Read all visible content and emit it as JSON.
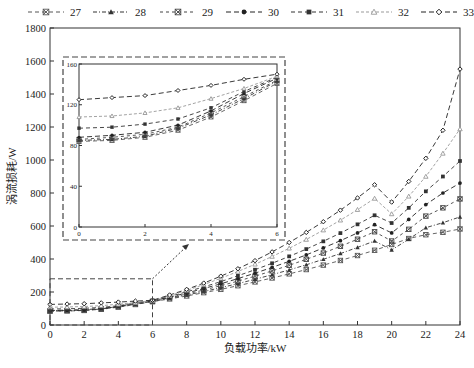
{
  "chart_data": {
    "type": "line",
    "title": "",
    "xlabel": "负载功率/kW",
    "ylabel": "涡流损耗/W",
    "xlim": [
      0,
      24
    ],
    "ylim": [
      0,
      1800
    ],
    "xticks": [
      0,
      2,
      4,
      6,
      8,
      10,
      12,
      14,
      16,
      18,
      20,
      22,
      24
    ],
    "yticks": [
      0,
      200,
      400,
      600,
      800,
      1000,
      1200,
      1400,
      1600,
      1800
    ],
    "grid": false,
    "legend_position": "top",
    "x": [
      0,
      1,
      2,
      3,
      4,
      5,
      6,
      7,
      8,
      9,
      10,
      11,
      12,
      13,
      14,
      15,
      16,
      17,
      18,
      19,
      20,
      21,
      22,
      23,
      24
    ],
    "series": [
      {
        "name": "27",
        "marker": "x-square",
        "color": "#555555",
        "values": [
          84,
          85,
          88,
          95,
          108,
          124,
          141,
          158,
          176,
          196,
          216,
          238,
          261,
          285,
          310,
          336,
          363,
          391,
          421,
          453,
          488,
          524,
          547,
          562,
          582
        ]
      },
      {
        "name": "28",
        "marker": "triangle",
        "color": "#333333",
        "values": [
          85,
          86,
          89,
          97,
          110,
          126,
          143,
          162,
          182,
          203,
          226,
          251,
          277,
          305,
          334,
          365,
          398,
          433,
          470,
          509,
          455,
          520,
          590,
          620,
          655
        ]
      },
      {
        "name": "29",
        "marker": "x-box",
        "color": "#444444",
        "values": [
          86,
          88,
          91,
          98,
          112,
          128,
          144,
          165,
          188,
          212,
          238,
          266,
          296,
          328,
          362,
          398,
          436,
          477,
          520,
          565,
          509,
          580,
          660,
          710,
          764
        ]
      },
      {
        "name": "30",
        "marker": "circle",
        "color": "#222222",
        "values": [
          88,
          90,
          93,
          100,
          114,
          131,
          146,
          169,
          194,
          221,
          250,
          281,
          314,
          349,
          386,
          425,
          467,
          511,
          558,
          608,
          558,
          640,
          730,
          800,
          860
        ]
      },
      {
        "name": "31",
        "marker": "square",
        "color": "#333333",
        "values": [
          97,
          98,
          101,
          106,
          117,
          133,
          147,
          173,
          201,
          231,
          263,
          298,
          335,
          374,
          416,
          460,
          507,
          557,
          610,
          665,
          618,
          710,
          810,
          900,
          994
        ]
      },
      {
        "name": "32",
        "marker": "triangle-open",
        "color": "#999999",
        "values": [
          108,
          109,
          112,
          117,
          126,
          136,
          148,
          178,
          210,
          245,
          283,
          324,
          368,
          415,
          465,
          518,
          575,
          635,
          699,
          767,
          673,
          780,
          900,
          1040,
          1188
        ]
      },
      {
        "name": "33",
        "marker": "diamond-open",
        "color": "#222222",
        "values": [
          125,
          127,
          129,
          134,
          139,
          145,
          150,
          182,
          216,
          254,
          296,
          341,
          390,
          443,
          500,
          561,
          626,
          696,
          770,
          850,
          745,
          870,
          1010,
          1180,
          1551
        ]
      }
    ],
    "inset": {
      "xlim": [
        0,
        6
      ],
      "ylim": [
        0,
        160
      ],
      "xticks": [
        0,
        2,
        4,
        6
      ],
      "yticks": [
        0,
        40,
        80,
        120,
        160
      ],
      "zoom_region": {
        "x": [
          0,
          6
        ],
        "y": [
          0,
          280
        ]
      }
    }
  },
  "legend": {
    "items": [
      {
        "label": "27"
      },
      {
        "label": "28"
      },
      {
        "label": "29"
      },
      {
        "label": "30"
      },
      {
        "label": "31"
      },
      {
        "label": "32"
      },
      {
        "label": "33"
      }
    ]
  },
  "axes": {
    "xlabel": "负载功率/kW",
    "ylabel": "涡流损耗/W"
  }
}
